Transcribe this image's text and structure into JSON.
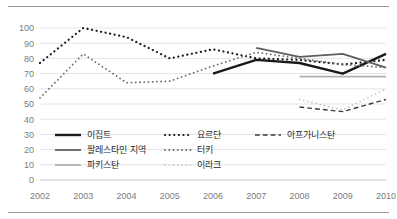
{
  "chart_data": {
    "type": "line",
    "title": "",
    "subtitle": "",
    "xlabel": "",
    "ylabel": "",
    "categories": [
      2002,
      2003,
      2004,
      2005,
      2006,
      2007,
      2008,
      2009,
      2010
    ],
    "x_tick_labels": [
      "2002",
      "2003",
      "2004",
      "2005",
      "2006",
      "2007",
      "2008",
      "2009",
      "2010"
    ],
    "y_tick_labels": [
      "0",
      "10",
      "20",
      "30",
      "40",
      "50",
      "60",
      "70",
      "80",
      "90",
      "100"
    ],
    "y_ticks": [
      0,
      10,
      20,
      30,
      40,
      50,
      60,
      70,
      80,
      90,
      100
    ],
    "ylim": [
      0,
      100
    ],
    "grid": "horizontal",
    "legend_position": "inside-lower-left",
    "series": [
      {
        "name": "이집트",
        "style": "solid",
        "color": "#1a1a1a",
        "width": 2.4,
        "x": [
          2006,
          2007,
          2008,
          2009,
          2010
        ],
        "values": [
          70,
          79,
          77,
          70,
          83
        ]
      },
      {
        "name": "요르단",
        "style": "dotted-large",
        "color": "#1a1a1a",
        "width": 2.2,
        "x": [
          2002,
          2003,
          2004,
          2005,
          2006,
          2007,
          2008,
          2009,
          2010
        ],
        "values": [
          77,
          100,
          94,
          80,
          86,
          80,
          79,
          76,
          79
        ]
      },
      {
        "name": "아프가니스탄",
        "style": "dashed",
        "color": "#3a3a3a",
        "width": 1.4,
        "x": [
          2008,
          2009,
          2010
        ],
        "values": [
          48,
          45,
          53
        ]
      },
      {
        "name": "팔레스타인 지역",
        "style": "solid",
        "color": "#5e5e5e",
        "width": 1.8,
        "x": [
          2007,
          2008,
          2009,
          2010
        ],
        "values": [
          87,
          81,
          83,
          74
        ]
      },
      {
        "name": "터키",
        "style": "dotted-medium",
        "color": "#6a6a6a",
        "width": 1.8,
        "x": [
          2002,
          2003,
          2004,
          2005,
          2006,
          2007,
          2008,
          2009,
          2010
        ],
        "values": [
          54,
          83,
          64,
          65,
          75,
          84,
          80,
          76,
          74
        ]
      },
      {
        "name": "파키스탄",
        "style": "solid",
        "color": "#b0b0b0",
        "width": 1.8,
        "x": [
          2008,
          2009,
          2010
        ],
        "values": [
          68,
          68,
          68
        ]
      },
      {
        "name": "이라크",
        "style": "dotted-small",
        "color": "#bdbdbd",
        "width": 1.6,
        "x": [
          2008,
          2009,
          2010
        ],
        "values": [
          53,
          46,
          60
        ]
      }
    ]
  },
  "legend": {
    "entries": [
      {
        "label": "이집트",
        "key": "이집트"
      },
      {
        "label": "요르단",
        "key": "요르단"
      },
      {
        "label": "아프가니스탄",
        "key": "아프가니스탄"
      },
      {
        "label": "팔레스타인 지역",
        "key": "팔레스타인 지역"
      },
      {
        "label": "터키",
        "key": "터키"
      },
      {
        "label": "이라크",
        "key": "이라크"
      },
      {
        "label": "파키스탄",
        "key": "파키스탄"
      }
    ]
  },
  "colors": {
    "grid": "#e4e4e4",
    "axis": "#c9c9c9",
    "tick_text": "#7c7c7c",
    "legend_text": "#2b2b2b",
    "rule": "#9a9a9a",
    "background": "#ffffff"
  }
}
